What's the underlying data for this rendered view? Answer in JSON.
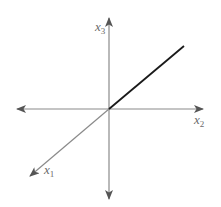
{
  "diagram": {
    "title": "",
    "origin": {
      "x": 109,
      "y": 109
    },
    "colors": {
      "axis": "#8a8a8a",
      "line": "#1a1a1a",
      "label": "#6a6a6a",
      "background": "#ffffff"
    },
    "axes": [
      {
        "name": "x1",
        "label": "x",
        "subscript": "1",
        "direction": "lower-left"
      },
      {
        "name": "x2",
        "label": "x",
        "subscript": "2",
        "direction": "right"
      },
      {
        "name": "x3",
        "label": "x",
        "subscript": "3",
        "direction": "up"
      }
    ],
    "line": {
      "description": "line through origin in positive octant direction",
      "from": "origin",
      "to": "upper-right"
    }
  }
}
